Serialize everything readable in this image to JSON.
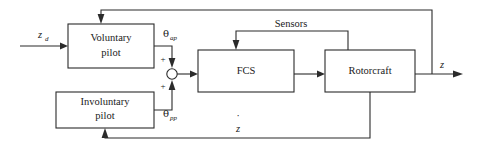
{
  "diagram": {
    "blocks": [
      {
        "id": "voluntary_pilot",
        "line1": "Voluntary",
        "line2": "pilot"
      },
      {
        "id": "involuntary_pilot",
        "line1": "Involuntary",
        "line2": "pilot"
      },
      {
        "id": "fcs",
        "line1": "FCS",
        "line2": ""
      },
      {
        "id": "rotorcraft",
        "line1": "Rotorcraft",
        "line2": ""
      }
    ],
    "signals": {
      "input": "z",
      "input_sub": "d",
      "theta_symbol": "θ",
      "theta_ap_sub": "ap",
      "theta_pp_sub": "pp",
      "sensors": "Sensors",
      "output": "z",
      "feedback_rate": "z",
      "feedback_rate_accent": "˙",
      "sum_sign_top": "+",
      "sum_sign_bottom": "+"
    },
    "colors": {
      "line": "#2b2b2b",
      "text": "#1a1a1a",
      "background": "#ffffff"
    }
  }
}
